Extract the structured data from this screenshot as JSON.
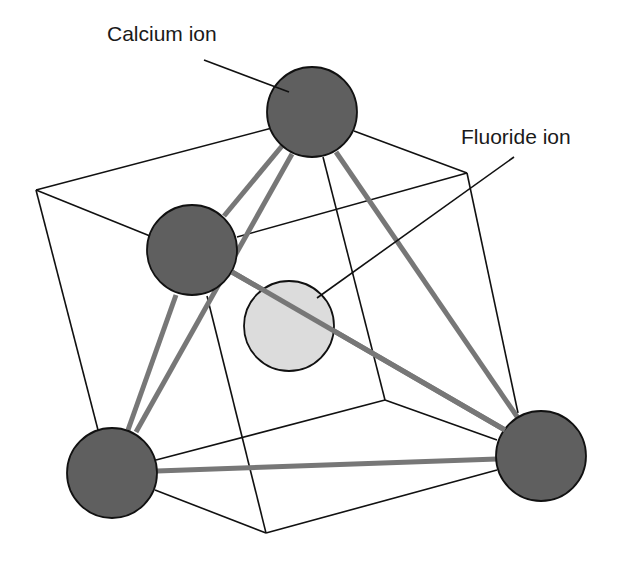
{
  "diagram": {
    "type": "crystal-structure",
    "title": "",
    "labels": {
      "calcium": "Calcium ion",
      "fluoride": "Fluoride ion"
    },
    "colors": {
      "calcium_fill": "#5f5f5f",
      "fluoride_fill": "#dcdcdc",
      "bond": "#777777",
      "edge": "#111111",
      "background": "#ffffff"
    },
    "ions": [
      {
        "id": "ca-top",
        "kind": "calcium"
      },
      {
        "id": "ca-left",
        "kind": "calcium"
      },
      {
        "id": "ca-bottom-left",
        "kind": "calcium"
      },
      {
        "id": "ca-bottom-right",
        "kind": "calcium"
      },
      {
        "id": "f-center",
        "kind": "fluoride"
      }
    ],
    "bonds": [
      [
        "ca-top",
        "ca-left"
      ],
      [
        "ca-top",
        "ca-bottom-left"
      ],
      [
        "ca-top",
        "ca-bottom-right"
      ],
      [
        "ca-left",
        "ca-bottom-left"
      ],
      [
        "ca-left",
        "ca-bottom-right"
      ],
      [
        "ca-bottom-left",
        "ca-bottom-right"
      ]
    ]
  }
}
